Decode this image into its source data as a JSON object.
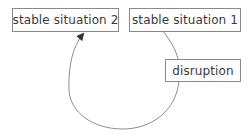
{
  "diagram": {
    "type": "cycle",
    "nodes": [
      {
        "id": "stable2",
        "label": "stable situation 2"
      },
      {
        "id": "stable1",
        "label": "stable situation 1"
      },
      {
        "id": "disruption",
        "label": "disruption"
      }
    ],
    "edges": [
      {
        "from": "stable1",
        "to": "disruption"
      },
      {
        "from": "disruption",
        "to": "stable2",
        "arrow": true
      }
    ],
    "colors": {
      "line": "#808080",
      "border": "#8a8a8a",
      "text": "#3a3a3a",
      "background": "#ffffff"
    }
  }
}
